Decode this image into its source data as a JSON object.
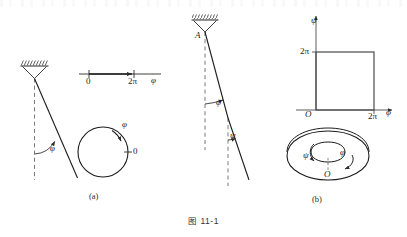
{
  "figure": {
    "caption": "图 11-1",
    "panels": [
      {
        "tag": "(a)",
        "x": 95,
        "y": 193
      },
      {
        "tag": "(b)",
        "x": 318,
        "y": 196
      }
    ]
  },
  "panel_a": {
    "pendulum": {
      "angle_label": "φ",
      "support_hatch": true,
      "dashed_reference": true
    },
    "phi_axis": {
      "axis_label": "φ",
      "ticks": [
        {
          "label": "0",
          "x": 89
        },
        {
          "label": "2π",
          "x": 134
        }
      ],
      "arrow_label": "φ"
    },
    "circle": {
      "label": "φ",
      "origin_label": "0",
      "center_x": 103,
      "center_y": 152,
      "radius": 25
    }
  },
  "panel_b": {
    "double_pendulum": {
      "pivot_label": "A",
      "upper_angle_label": "φ",
      "lower_angle_label": "ψ",
      "support_hatch": true
    },
    "square": {
      "x_axis_label": "φ",
      "y_axis_label": "ψ",
      "origin_label": "O",
      "x_tick_label": "2π",
      "y_tick_label": "2π"
    },
    "torus": {
      "psi_label": "ψ",
      "phi_label": "φ",
      "origin_label": "O"
    }
  },
  "colors": {
    "ink": "#1c1c1c",
    "line": "#2b2b2b",
    "dashed": "#6a6a6a",
    "background": "#ffffff"
  }
}
